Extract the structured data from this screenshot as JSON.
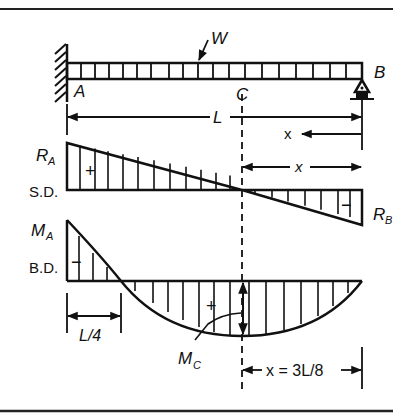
{
  "figure": {
    "type": "beam-diagram"
  },
  "beam": {
    "load_label": "W",
    "left_end_label": "A",
    "right_end_label": "B",
    "section_label": "C",
    "span_label": "L",
    "x_label": "x",
    "left_support": "fixed",
    "right_support": "roller"
  },
  "shear_diagram": {
    "name": "S.D.",
    "left_value_label": "R",
    "left_value_sub": "A",
    "right_value_label": "R",
    "right_value_sub": "B",
    "positive_sign": "+",
    "negative_sign": "−",
    "x_label": "x"
  },
  "moment_diagram": {
    "name": "B.D.",
    "left_value_label": "M",
    "left_value_sub": "A",
    "max_label": "M",
    "max_sub": "C",
    "positive_sign": "+",
    "negative_sign": "−",
    "inflection_label": "L/4",
    "max_position_label": "x = 3L/8"
  },
  "colors": {
    "ink": "#111111",
    "paper": "#ffffff"
  }
}
